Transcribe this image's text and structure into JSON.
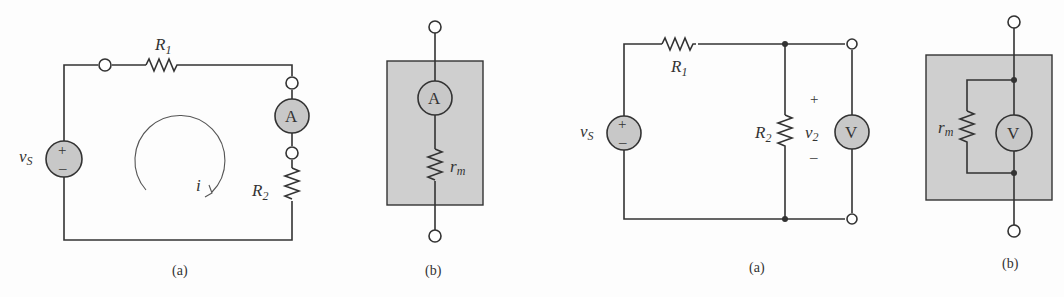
{
  "figures": [
    {
      "id": "ammeter-circuit",
      "caption": "(a)",
      "source_label": "v",
      "source_sub": "S",
      "r1_label": "R",
      "r1_sub": "1",
      "r2_label": "R",
      "r2_sub": "2",
      "meter_label": "A",
      "current_label": "i",
      "plus": "+",
      "minus": "–"
    },
    {
      "id": "ammeter-model",
      "caption": "(b)",
      "meter_label": "A",
      "rm_label": "r",
      "rm_sub": "m"
    },
    {
      "id": "voltmeter-circuit",
      "caption": "(a)",
      "source_label": "v",
      "source_sub": "S",
      "r1_label": "R",
      "r1_sub": "1",
      "r2_label": "R",
      "r2_sub": "2",
      "v2_label": "v",
      "v2_sub": "2",
      "meter_label": "V",
      "plus": "+",
      "minus": "–"
    },
    {
      "id": "voltmeter-model",
      "caption": "(b)",
      "meter_label": "V",
      "rm_label": "r",
      "rm_sub": "m"
    }
  ],
  "colors": {
    "wire": "#333333",
    "meter_fill": "#c8c8c8",
    "box_fill": "#cfcfcf",
    "background": "#fdfdfd"
  }
}
